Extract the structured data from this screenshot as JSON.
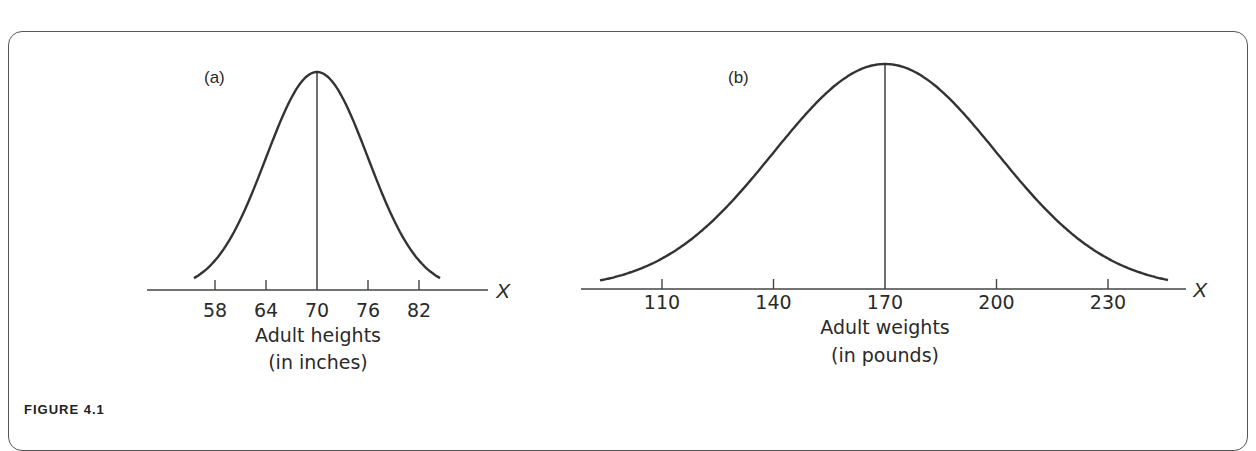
{
  "figure": {
    "caption": "FIGURE 4.1"
  },
  "chart_data": [
    {
      "type": "line",
      "panel_label": "(a)",
      "title": "",
      "xlabel": "Adult heights",
      "xlabel_units": "(in inches)",
      "variable": "X",
      "ticks": [
        "58",
        "64",
        "70",
        "76",
        "82"
      ],
      "tick_values": [
        58,
        64,
        70,
        76,
        82
      ],
      "mean": 70,
      "sd": 6,
      "distribution": "normal",
      "mean_line": true,
      "grid": false
    },
    {
      "type": "line",
      "panel_label": "(b)",
      "title": "",
      "xlabel": "Adult weights",
      "xlabel_units": "(in pounds)",
      "variable": "X",
      "ticks": [
        "110",
        "140",
        "170",
        "200",
        "230"
      ],
      "tick_values": [
        110,
        140,
        170,
        200,
        230
      ],
      "mean": 170,
      "sd": 30,
      "distribution": "normal",
      "mean_line": true,
      "grid": false
    }
  ]
}
